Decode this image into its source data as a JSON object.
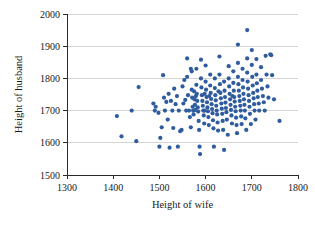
{
  "chart_data": {
    "type": "scatter",
    "title": "",
    "xlabel": "Height of wife",
    "ylabel": "Height of husband",
    "xlim": [
      1300,
      1800
    ],
    "ylim": [
      1500,
      2000
    ],
    "xticks": [
      1300,
      1400,
      1500,
      1600,
      1700,
      1800
    ],
    "yticks": [
      1500,
      1600,
      1700,
      1800,
      1900,
      2000
    ],
    "xtick_labels": [
      "1300",
      "1400",
      "1500",
      "1600",
      "1700",
      "1800"
    ],
    "ytick_labels": [
      "1500",
      "1600",
      "1700",
      "1800",
      "1900",
      "2000"
    ],
    "grid": "horizontal",
    "legend": "none",
    "marker": {
      "shape": "circle",
      "color": "#2f5c9e",
      "size_px": 3.0
    },
    "n_points": 199,
    "points": [
      [
        1408,
        1683
      ],
      [
        1418,
        1620
      ],
      [
        1440,
        1700
      ],
      [
        1450,
        1605
      ],
      [
        1455,
        1773
      ],
      [
        1487,
        1722
      ],
      [
        1490,
        1700
      ],
      [
        1492,
        1712
      ],
      [
        1498,
        1693
      ],
      [
        1500,
        1588
      ],
      [
        1502,
        1615
      ],
      [
        1505,
        1648
      ],
      [
        1508,
        1810
      ],
      [
        1510,
        1740
      ],
      [
        1512,
        1700
      ],
      [
        1515,
        1727
      ],
      [
        1518,
        1672
      ],
      [
        1520,
        1752
      ],
      [
        1522,
        1585
      ],
      [
        1525,
        1730
      ],
      [
        1528,
        1700
      ],
      [
        1530,
        1646
      ],
      [
        1532,
        1768
      ],
      [
        1535,
        1720
      ],
      [
        1538,
        1745
      ],
      [
        1540,
        1588
      ],
      [
        1542,
        1700
      ],
      [
        1545,
        1636
      ],
      [
        1548,
        1640
      ],
      [
        1550,
        1775
      ],
      [
        1552,
        1722
      ],
      [
        1554,
        1795
      ],
      [
        1556,
        1733
      ],
      [
        1558,
        1700
      ],
      [
        1560,
        1862
      ],
      [
        1560,
        1805
      ],
      [
        1562,
        1748
      ],
      [
        1564,
        1700
      ],
      [
        1566,
        1680
      ],
      [
        1568,
        1648
      ],
      [
        1570,
        1822
      ],
      [
        1570,
        1765
      ],
      [
        1571,
        1740
      ],
      [
        1572,
        1712
      ],
      [
        1573,
        1700
      ],
      [
        1574,
        1688
      ],
      [
        1575,
        1760
      ],
      [
        1576,
        1735
      ],
      [
        1577,
        1718
      ],
      [
        1578,
        1702
      ],
      [
        1579,
        1745
      ],
      [
        1580,
        1830
      ],
      [
        1580,
        1780
      ],
      [
        1581,
        1752
      ],
      [
        1582,
        1730
      ],
      [
        1583,
        1710
      ],
      [
        1584,
        1697
      ],
      [
        1585,
        1668
      ],
      [
        1586,
        1640
      ],
      [
        1587,
        1588
      ],
      [
        1588,
        1565
      ],
      [
        1590,
        1858
      ],
      [
        1590,
        1800
      ],
      [
        1591,
        1772
      ],
      [
        1592,
        1748
      ],
      [
        1593,
        1730
      ],
      [
        1594,
        1715
      ],
      [
        1595,
        1700
      ],
      [
        1596,
        1685
      ],
      [
        1597,
        1660
      ],
      [
        1598,
        1752
      ],
      [
        1600,
        1840
      ],
      [
        1600,
        1790
      ],
      [
        1601,
        1765
      ],
      [
        1602,
        1742
      ],
      [
        1603,
        1726
      ],
      [
        1604,
        1710
      ],
      [
        1605,
        1698
      ],
      [
        1606,
        1680
      ],
      [
        1607,
        1655
      ],
      [
        1608,
        1745
      ],
      [
        1610,
        1812
      ],
      [
        1610,
        1778
      ],
      [
        1611,
        1755
      ],
      [
        1612,
        1736
      ],
      [
        1613,
        1720
      ],
      [
        1614,
        1705
      ],
      [
        1615,
        1692
      ],
      [
        1616,
        1670
      ],
      [
        1617,
        1645
      ],
      [
        1618,
        1588
      ],
      [
        1620,
        1800
      ],
      [
        1620,
        1770
      ],
      [
        1621,
        1748
      ],
      [
        1622,
        1732
      ],
      [
        1623,
        1715
      ],
      [
        1624,
        1700
      ],
      [
        1625,
        1688
      ],
      [
        1626,
        1663
      ],
      [
        1627,
        1638
      ],
      [
        1628,
        1760
      ],
      [
        1630,
        1868
      ],
      [
        1630,
        1812
      ],
      [
        1631,
        1782
      ],
      [
        1632,
        1755
      ],
      [
        1633,
        1738
      ],
      [
        1634,
        1722
      ],
      [
        1635,
        1706
      ],
      [
        1636,
        1690
      ],
      [
        1637,
        1668
      ],
      [
        1638,
        1640
      ],
      [
        1640,
        1578
      ],
      [
        1640,
        1790
      ],
      [
        1641,
        1762
      ],
      [
        1642,
        1742
      ],
      [
        1643,
        1725
      ],
      [
        1644,
        1708
      ],
      [
        1645,
        1695
      ],
      [
        1646,
        1672
      ],
      [
        1648,
        1625
      ],
      [
        1650,
        1838
      ],
      [
        1650,
        1800
      ],
      [
        1651,
        1775
      ],
      [
        1652,
        1752
      ],
      [
        1653,
        1735
      ],
      [
        1654,
        1718
      ],
      [
        1655,
        1702
      ],
      [
        1656,
        1685
      ],
      [
        1657,
        1660
      ],
      [
        1658,
        1745
      ],
      [
        1660,
        1822
      ],
      [
        1660,
        1786
      ],
      [
        1661,
        1762
      ],
      [
        1662,
        1742
      ],
      [
        1663,
        1728
      ],
      [
        1664,
        1712
      ],
      [
        1665,
        1698
      ],
      [
        1666,
        1678
      ],
      [
        1667,
        1655
      ],
      [
        1668,
        1630
      ],
      [
        1670,
        1905
      ],
      [
        1670,
        1848
      ],
      [
        1670,
        1805
      ],
      [
        1671,
        1782
      ],
      [
        1672,
        1762
      ],
      [
        1673,
        1745
      ],
      [
        1674,
        1730
      ],
      [
        1675,
        1715
      ],
      [
        1676,
        1700
      ],
      [
        1677,
        1682
      ],
      [
        1678,
        1658
      ],
      [
        1680,
        1830
      ],
      [
        1680,
        1795
      ],
      [
        1681,
        1772
      ],
      [
        1682,
        1752
      ],
      [
        1683,
        1735
      ],
      [
        1684,
        1718
      ],
      [
        1685,
        1700
      ],
      [
        1686,
        1676
      ],
      [
        1688,
        1640
      ],
      [
        1690,
        1950
      ],
      [
        1690,
        1862
      ],
      [
        1690,
        1818
      ],
      [
        1691,
        1790
      ],
      [
        1692,
        1768
      ],
      [
        1693,
        1748
      ],
      [
        1694,
        1730
      ],
      [
        1695,
        1712
      ],
      [
        1696,
        1690
      ],
      [
        1698,
        1658
      ],
      [
        1700,
        1888
      ],
      [
        1700,
        1842
      ],
      [
        1701,
        1805
      ],
      [
        1702,
        1778
      ],
      [
        1703,
        1755
      ],
      [
        1704,
        1738
      ],
      [
        1705,
        1720
      ],
      [
        1706,
        1700
      ],
      [
        1708,
        1672
      ],
      [
        1710,
        1860
      ],
      [
        1710,
        1812
      ],
      [
        1711,
        1785
      ],
      [
        1712,
        1762
      ],
      [
        1713,
        1742
      ],
      [
        1715,
        1722
      ],
      [
        1716,
        1700
      ],
      [
        1720,
        1835
      ],
      [
        1720,
        1795
      ],
      [
        1722,
        1768
      ],
      [
        1724,
        1745
      ],
      [
        1726,
        1726
      ],
      [
        1728,
        1700
      ],
      [
        1730,
        1870
      ],
      [
        1732,
        1812
      ],
      [
        1734,
        1775
      ],
      [
        1736,
        1740
      ],
      [
        1740,
        1875
      ],
      [
        1742,
        1872
      ],
      [
        1744,
        1810
      ],
      [
        1748,
        1735
      ],
      [
        1760,
        1668
      ],
      [
        1568,
        1830
      ],
      [
        1598,
        1700
      ]
    ]
  }
}
